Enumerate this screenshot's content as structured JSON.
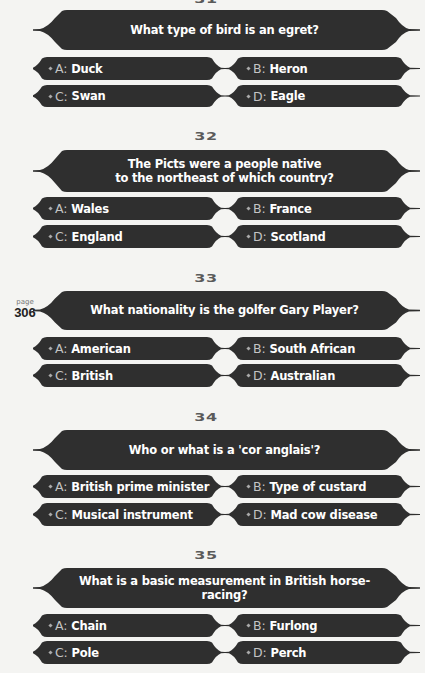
{
  "page": {
    "label": "page",
    "number": "306"
  },
  "colors": {
    "background": "#f4f4f2",
    "shape_fill": "#2f2f2f",
    "question_number": "#5a5a5a",
    "answer_letter": "#c4c4c4",
    "text": "#ffffff"
  },
  "questions": [
    {
      "number": "31",
      "question": "What type of bird is an egret?",
      "answers": [
        {
          "letter": "A:",
          "text": "Duck"
        },
        {
          "letter": "B:",
          "text": "Heron"
        },
        {
          "letter": "C:",
          "text": "Swan"
        },
        {
          "letter": "D:",
          "text": "Eagle"
        }
      ]
    },
    {
      "number": "32",
      "question": "The Picts were a people native to the northeast of which country?",
      "question_line1": "The Picts were a people native",
      "question_line2": "to the northeast of which country?",
      "answers": [
        {
          "letter": "A:",
          "text": "Wales"
        },
        {
          "letter": "B:",
          "text": "France"
        },
        {
          "letter": "C:",
          "text": "England"
        },
        {
          "letter": "D:",
          "text": "Scotland"
        }
      ]
    },
    {
      "number": "33",
      "question": "What nationality is the golfer Gary Player?",
      "answers": [
        {
          "letter": "A:",
          "text": "American"
        },
        {
          "letter": "B:",
          "text": "South African"
        },
        {
          "letter": "C:",
          "text": "British"
        },
        {
          "letter": "D:",
          "text": "Australian"
        }
      ]
    },
    {
      "number": "34",
      "question": "Who or what is a 'cor anglais'?",
      "answers": [
        {
          "letter": "A:",
          "text": "British prime minister"
        },
        {
          "letter": "B:",
          "text": "Type of custard"
        },
        {
          "letter": "C:",
          "text": "Musical instrument"
        },
        {
          "letter": "D:",
          "text": "Mad cow disease"
        }
      ]
    },
    {
      "number": "35",
      "question": "What is a basic measurement in British horse-racing?",
      "answers": [
        {
          "letter": "A:",
          "text": "Chain"
        },
        {
          "letter": "B:",
          "text": "Furlong"
        },
        {
          "letter": "C:",
          "text": "Pole"
        },
        {
          "letter": "D:",
          "text": "Perch"
        }
      ]
    }
  ]
}
